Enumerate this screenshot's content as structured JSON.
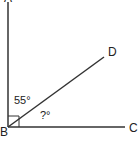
{
  "diagram": {
    "type": "geometry-angle",
    "points": {
      "A": {
        "label": "A"
      },
      "B": {
        "label": "B"
      },
      "C": {
        "label": "C"
      },
      "D": {
        "label": "D"
      }
    },
    "angles": {
      "ABD": {
        "label": "55°",
        "value": 55
      },
      "DBC": {
        "label": "?°",
        "value": null
      }
    },
    "right_angle": "ABC",
    "colors": {
      "line": "#333333",
      "background": "#ffffff"
    }
  }
}
